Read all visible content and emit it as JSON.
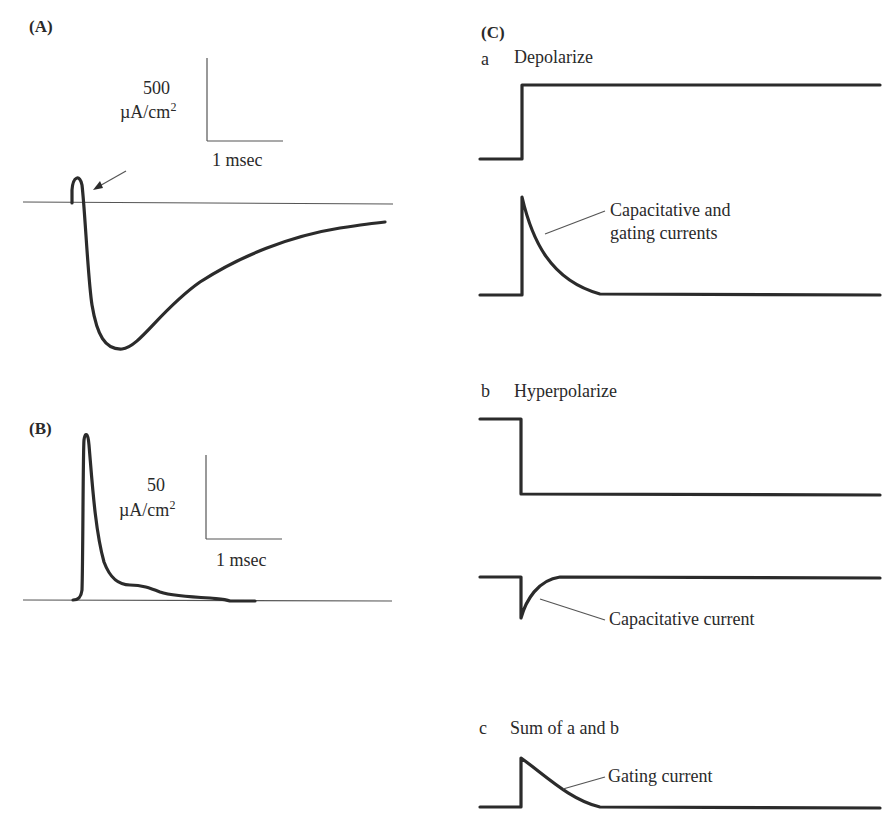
{
  "panels": {
    "A": {
      "label": "(A)",
      "scale_y_value": "500",
      "scale_y_unit": "µA/cm",
      "scale_y_unit_sup": "2",
      "scale_x": "1 msec"
    },
    "B": {
      "label": "(B)",
      "scale_y_value": "50",
      "scale_y_unit": "µA/cm",
      "scale_y_unit_sup": "2",
      "scale_x": "1 msec"
    },
    "C": {
      "label": "(C)",
      "a": {
        "letter": "a",
        "title": "Depolarize",
        "annotation_line1": "Capacitative and",
        "annotation_line2": "gating currents"
      },
      "b": {
        "letter": "b",
        "title": "Hyperpolarize",
        "annotation": "Capacitative current"
      },
      "c": {
        "letter": "c",
        "title": "Sum of a and b",
        "annotation": "Gating current"
      }
    }
  },
  "colors": {
    "trace": "#2b2b2b",
    "axis": "#555555",
    "background": "#ffffff"
  }
}
